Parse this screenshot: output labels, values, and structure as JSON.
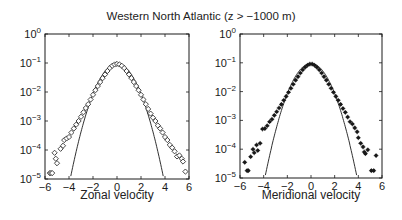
{
  "figure": {
    "title": "Western North Atlantic (z > −1000 m)",
    "background": "#ffffff",
    "ink": "#1a1a1a"
  },
  "chart_data": [
    {
      "type": "scatter",
      "panel": "left",
      "title": "",
      "xlabel": "Zonal velocity",
      "ylabel": "",
      "xlim": [
        -6,
        6
      ],
      "ylim": [
        1e-05,
        1
      ],
      "yscale": "log",
      "xticks": [
        -6,
        -4,
        -2,
        0,
        2,
        4,
        6
      ],
      "xtick_labels": [
        "−6",
        "−4",
        "−2",
        "0",
        "2",
        "4",
        "6"
      ],
      "yticks": [
        1,
        0.1,
        0.01,
        0.001,
        0.0001,
        1e-05
      ],
      "ytick_labels": [
        {
          "base": "10",
          "exp": "0"
        },
        {
          "base": "10",
          "exp": "−1"
        },
        {
          "base": "10",
          "exp": "−2"
        },
        {
          "base": "10",
          "exp": "−3"
        },
        {
          "base": "10",
          "exp": "−4"
        },
        {
          "base": "10",
          "exp": "−5"
        }
      ],
      "grid": false,
      "marker": "diamond-open",
      "series": [
        {
          "name": "empirical PDF",
          "style": "open diamonds",
          "points": [
            [
              -5.6,
              1.6e-05
            ],
            [
              -5.5,
              1.6e-05
            ],
            [
              -5.4,
              1.6e-05
            ],
            [
              -5.2,
              8e-05
            ],
            [
              -5.1,
              5e-05
            ],
            [
              -5.0,
              3.5e-05
            ],
            [
              -4.7,
              0.00011
            ],
            [
              -4.5,
              0.00014
            ],
            [
              -4.4,
              0.00022
            ],
            [
              -4.2,
              0.00025
            ],
            [
              -4.0,
              0.00028
            ],
            [
              -3.8,
              0.0004
            ],
            [
              -3.6,
              0.00055
            ],
            [
              -3.4,
              0.00075
            ],
            [
              -3.2,
              0.001
            ],
            [
              -3.0,
              0.0014
            ],
            [
              -2.8,
              0.002
            ],
            [
              -2.6,
              0.0028
            ],
            [
              -2.4,
              0.0038
            ],
            [
              -2.2,
              0.0055
            ],
            [
              -2.0,
              0.008
            ],
            [
              -1.8,
              0.0115
            ],
            [
              -1.6,
              0.016
            ],
            [
              -1.4,
              0.022
            ],
            [
              -1.2,
              0.03
            ],
            [
              -1.0,
              0.04
            ],
            [
              -0.8,
              0.053
            ],
            [
              -0.6,
              0.067
            ],
            [
              -0.4,
              0.08
            ],
            [
              -0.2,
              0.089
            ],
            [
              0.0,
              0.093
            ],
            [
              0.2,
              0.089
            ],
            [
              0.4,
              0.08
            ],
            [
              0.6,
              0.067
            ],
            [
              0.8,
              0.053
            ],
            [
              1.0,
              0.04
            ],
            [
              1.2,
              0.03
            ],
            [
              1.4,
              0.022
            ],
            [
              1.6,
              0.016
            ],
            [
              1.8,
              0.0115
            ],
            [
              2.0,
              0.008
            ],
            [
              2.2,
              0.0055
            ],
            [
              2.4,
              0.0038
            ],
            [
              2.6,
              0.0026
            ],
            [
              2.8,
              0.0018
            ],
            [
              3.0,
              0.0013
            ],
            [
              3.2,
              0.001
            ],
            [
              3.4,
              0.0007
            ],
            [
              3.6,
              0.00055
            ],
            [
              3.8,
              0.0004
            ],
            [
              4.0,
              0.00028
            ],
            [
              4.2,
              0.00022
            ],
            [
              4.4,
              0.00015
            ],
            [
              4.6,
              0.00012
            ],
            [
              4.8,
              9e-05
            ],
            [
              5.0,
              6e-05
            ],
            [
              5.2,
              6.5e-05
            ],
            [
              5.4,
              5e-05
            ],
            [
              5.5,
              4e-05
            ],
            [
              5.7,
              1.8e-05
            ]
          ]
        },
        {
          "name": "Gaussian fit",
          "style": "solid line",
          "function": "0.095 * exp(-x^2 / 1.66)"
        }
      ]
    },
    {
      "type": "scatter",
      "panel": "right",
      "title": "",
      "xlabel": "Meridional velocity",
      "ylabel": "",
      "xlim": [
        -6,
        6
      ],
      "ylim": [
        1e-05,
        1
      ],
      "yscale": "log",
      "xticks": [
        -6,
        -4,
        -2,
        0,
        2,
        4,
        6
      ],
      "xtick_labels": [
        "−6",
        "−4",
        "−2",
        "0",
        "2",
        "4",
        "6"
      ],
      "yticks": [
        1,
        0.1,
        0.01,
        0.001,
        0.0001,
        1e-05
      ],
      "ytick_labels": [
        {
          "base": "10",
          "exp": "0"
        },
        {
          "base": "10",
          "exp": "−1"
        },
        {
          "base": "10",
          "exp": "−2"
        },
        {
          "base": "10",
          "exp": "−3"
        },
        {
          "base": "10",
          "exp": "−4"
        },
        {
          "base": "10",
          "exp": "−5"
        }
      ],
      "grid": false,
      "marker": "star-filled",
      "series": [
        {
          "name": "empirical PDF",
          "style": "filled stars",
          "points": [
            [
              -5.6,
              3.5e-05
            ],
            [
              -5.4,
              1.8e-05
            ],
            [
              -5.3,
              1.8e-05
            ],
            [
              -5.1,
              5.5e-05
            ],
            [
              -4.9,
              0.0001
            ],
            [
              -4.8,
              7.5e-05
            ],
            [
              -4.6,
              0.00014
            ],
            [
              -4.5,
              9e-05
            ],
            [
              -4.3,
              0.00016
            ],
            [
              -4.1,
              0.0005
            ],
            [
              -3.9,
              0.00052
            ],
            [
              -3.7,
              0.00065
            ],
            [
              -3.5,
              0.0009
            ],
            [
              -3.3,
              0.0011
            ],
            [
              -3.1,
              0.0015
            ],
            [
              -2.9,
              0.002
            ],
            [
              -2.7,
              0.0027
            ],
            [
              -2.5,
              0.0036
            ],
            [
              -2.3,
              0.005
            ],
            [
              -2.1,
              0.0068
            ],
            [
              -1.9,
              0.0095
            ],
            [
              -1.7,
              0.013
            ],
            [
              -1.5,
              0.018
            ],
            [
              -1.3,
              0.025
            ],
            [
              -1.1,
              0.033
            ],
            [
              -0.9,
              0.044
            ],
            [
              -0.7,
              0.057
            ],
            [
              -0.5,
              0.07
            ],
            [
              -0.3,
              0.082
            ],
            [
              -0.1,
              0.09
            ],
            [
              0.1,
              0.09
            ],
            [
              0.3,
              0.082
            ],
            [
              0.5,
              0.07
            ],
            [
              0.7,
              0.057
            ],
            [
              0.9,
              0.044
            ],
            [
              1.1,
              0.033
            ],
            [
              1.3,
              0.025
            ],
            [
              1.5,
              0.018
            ],
            [
              1.7,
              0.013
            ],
            [
              1.9,
              0.0095
            ],
            [
              2.1,
              0.0068
            ],
            [
              2.3,
              0.005
            ],
            [
              2.5,
              0.0036
            ],
            [
              2.7,
              0.0026
            ],
            [
              2.9,
              0.0019
            ],
            [
              3.1,
              0.0013
            ],
            [
              3.3,
              0.0009
            ],
            [
              3.5,
              0.00075
            ],
            [
              3.7,
              0.00055
            ],
            [
              3.9,
              0.0004
            ],
            [
              4.0,
              0.00025
            ],
            [
              4.2,
              0.00016
            ],
            [
              4.4,
              0.00012
            ],
            [
              4.5,
              8e-05
            ],
            [
              4.6,
              7e-05
            ],
            [
              4.8,
              9.5e-05
            ],
            [
              5.1,
              1.8e-05
            ],
            [
              5.3,
              1.8e-05
            ],
            [
              5.5,
              6e-05
            ]
          ]
        },
        {
          "name": "Gaussian fit",
          "style": "solid line",
          "function": "0.095 * exp(-x^2 / 1.66)"
        }
      ]
    }
  ]
}
